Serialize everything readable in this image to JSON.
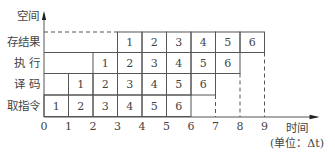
{
  "diagram": {
    "type": "pipeline-space-time",
    "y_axis_label": "空间",
    "x_axis_label": "时间",
    "x_axis_unit": "(单位：Δt)",
    "x_ticks": [
      "0",
      "1",
      "2",
      "3",
      "4",
      "5",
      "6",
      "7",
      "8",
      "9"
    ],
    "stages": [
      {
        "name": "存结果",
        "start": 3,
        "cells": [
          "1",
          "2",
          "3",
          "4",
          "5",
          "6"
        ]
      },
      {
        "name": "执 行",
        "start": 2,
        "cells": [
          "1",
          "2",
          "3",
          "4",
          "5",
          "6"
        ]
      },
      {
        "name": "译 码",
        "start": 1,
        "cells": [
          "1",
          "2",
          "3",
          "4",
          "5",
          "6"
        ]
      },
      {
        "name": "取指令",
        "start": 0,
        "cells": [
          "1",
          "2",
          "3",
          "4",
          "5",
          "6"
        ]
      }
    ],
    "dashed_verticals_at": [
      7,
      8,
      9
    ]
  }
}
